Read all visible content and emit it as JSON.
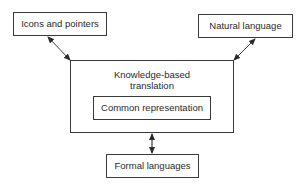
{
  "diagram": {
    "nodes": {
      "icons_pointers": {
        "label": "Icons and pointers"
      },
      "natural_language": {
        "label": "Natural language"
      },
      "knowledge_based": {
        "label_line1": "Knowledge-based",
        "label_line2": "translation"
      },
      "common_representation": {
        "label": "Common representation"
      },
      "formal_languages": {
        "label": "Formal languages"
      }
    },
    "edges": [
      {
        "from": "Icons and pointers",
        "to": "Knowledge-based translation",
        "type": "bidirectional-arrow"
      },
      {
        "from": "Natural language",
        "to": "Knowledge-based translation",
        "type": "bidirectional-arrow"
      },
      {
        "from": "Knowledge-based translation",
        "to": "Formal languages",
        "type": "bidirectional-arrow"
      }
    ],
    "colors": {
      "stroke": "#3a3a3a",
      "text": "#2a2a2a",
      "background": "#ffffff"
    }
  }
}
